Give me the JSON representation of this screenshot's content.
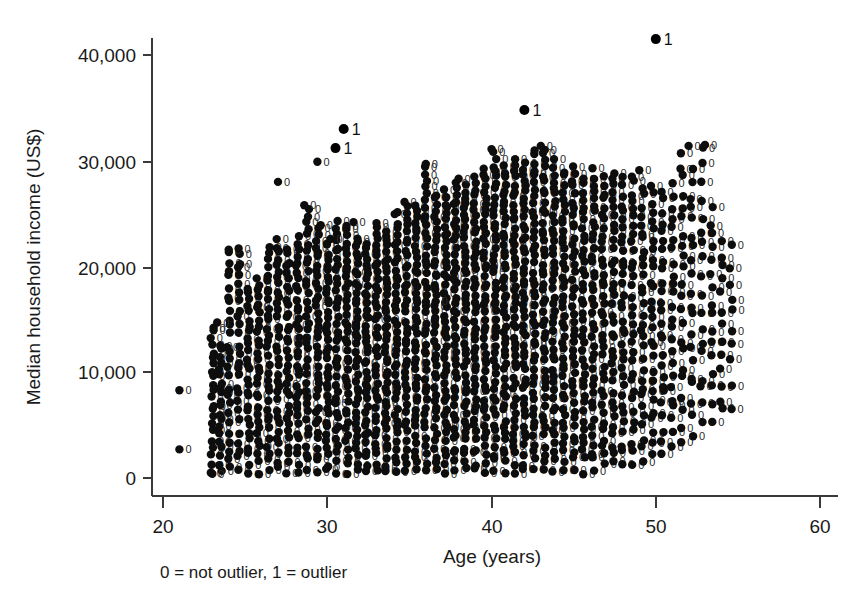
{
  "chart_data": {
    "type": "scatter",
    "title": "",
    "xlabel": "Age (years)",
    "ylabel": "Median household income (US$)",
    "xlim": [
      20,
      60
    ],
    "ylim": [
      0,
      44000
    ],
    "xticks": [
      20,
      30,
      40,
      50,
      60
    ],
    "xtick_labels": [
      "20",
      "30",
      "40",
      "50",
      "60"
    ],
    "yticks": [
      0,
      10000,
      20000,
      30000,
      40000
    ],
    "ytick_labels": [
      "0",
      "10,000",
      "20,000",
      "30,000",
      "40,000"
    ],
    "grid": false,
    "legend": "none",
    "caption": "0 = not outlier, 1 = outlier",
    "marker_label_key": {
      "0": "not outlier",
      "1": "outlier"
    },
    "point_marker": "filled-circle-with-numeric-label",
    "n_outliers": 4,
    "outliers": [
      {
        "x": 50.0,
        "y": 41500,
        "label": "1"
      },
      {
        "x": 42.0,
        "y": 34800,
        "label": "1"
      },
      {
        "x": 31.0,
        "y": 33000,
        "label": "1"
      },
      {
        "x": 30.5,
        "y": 31200,
        "label": "1"
      }
    ],
    "isolated_points": [
      {
        "x": 21.0,
        "y": 8300,
        "label": "0"
      },
      {
        "x": 21.0,
        "y": 2700,
        "label": "0"
      },
      {
        "x": 23.0,
        "y": 400,
        "label": "0"
      },
      {
        "x": 23.3,
        "y": 14700,
        "label": "0"
      },
      {
        "x": 24.0,
        "y": 21600,
        "label": "0"
      },
      {
        "x": 24.6,
        "y": 21700,
        "label": "0"
      },
      {
        "x": 27.0,
        "y": 28000,
        "label": "0"
      },
      {
        "x": 28.6,
        "y": 25800,
        "label": "0"
      },
      {
        "x": 29.4,
        "y": 29900,
        "label": "0"
      },
      {
        "x": 29.6,
        "y": 23900,
        "label": "0"
      },
      {
        "x": 30.2,
        "y": 22600,
        "label": "0"
      },
      {
        "x": 31.6,
        "y": 24200,
        "label": "0"
      },
      {
        "x": 33.0,
        "y": 24100,
        "label": "0"
      },
      {
        "x": 36.0,
        "y": 29700,
        "label": "0"
      },
      {
        "x": 36.6,
        "y": 16700,
        "label": "0"
      },
      {
        "x": 38.0,
        "y": 28300,
        "label": "0"
      },
      {
        "x": 40.0,
        "y": 31100,
        "label": "0"
      },
      {
        "x": 43.0,
        "y": 31400,
        "label": "0"
      },
      {
        "x": 49.0,
        "y": 29100,
        "label": "0"
      },
      {
        "x": 52.0,
        "y": 31400,
        "label": "0"
      },
      {
        "x": 53.0,
        "y": 31500,
        "label": "0"
      }
    ],
    "columns": [
      {
        "x": 23.0,
        "ymin": 300,
        "ymax": 14800,
        "density": 22
      },
      {
        "x": 23.5,
        "ymin": 300,
        "ymax": 13000,
        "density": 20
      },
      {
        "x": 24.0,
        "ymin": 300,
        "ymax": 21600,
        "density": 26
      },
      {
        "x": 24.6,
        "ymin": 300,
        "ymax": 21700,
        "density": 26
      },
      {
        "x": 25.2,
        "ymin": 300,
        "ymax": 18400,
        "density": 28
      },
      {
        "x": 25.8,
        "ymin": 300,
        "ymax": 19300,
        "density": 30
      },
      {
        "x": 26.4,
        "ymin": 300,
        "ymax": 22200,
        "density": 32
      },
      {
        "x": 27.0,
        "ymin": 300,
        "ymax": 22900,
        "density": 34
      },
      {
        "x": 27.6,
        "ymin": 300,
        "ymax": 22000,
        "density": 34
      },
      {
        "x": 28.2,
        "ymin": 300,
        "ymax": 23200,
        "density": 36
      },
      {
        "x": 28.8,
        "ymin": 300,
        "ymax": 25900,
        "density": 36
      },
      {
        "x": 29.4,
        "ymin": 300,
        "ymax": 24000,
        "density": 38
      },
      {
        "x": 30.0,
        "ymin": 300,
        "ymax": 22700,
        "density": 38
      },
      {
        "x": 30.6,
        "ymin": 300,
        "ymax": 24600,
        "density": 38
      },
      {
        "x": 31.2,
        "ymin": 300,
        "ymax": 24200,
        "density": 40
      },
      {
        "x": 31.8,
        "ymin": 300,
        "ymax": 23100,
        "density": 40
      },
      {
        "x": 32.4,
        "ymin": 300,
        "ymax": 22600,
        "density": 40
      },
      {
        "x": 33.0,
        "ymin": 300,
        "ymax": 24100,
        "density": 40
      },
      {
        "x": 33.6,
        "ymin": 300,
        "ymax": 23800,
        "density": 42
      },
      {
        "x": 34.2,
        "ymin": 300,
        "ymax": 25600,
        "density": 42
      },
      {
        "x": 34.8,
        "ymin": 300,
        "ymax": 26400,
        "density": 42
      },
      {
        "x": 35.4,
        "ymin": 300,
        "ymax": 26100,
        "density": 44
      },
      {
        "x": 36.0,
        "ymin": 300,
        "ymax": 29700,
        "density": 44
      },
      {
        "x": 36.6,
        "ymin": 300,
        "ymax": 27200,
        "density": 44
      },
      {
        "x": 37.2,
        "ymin": 300,
        "ymax": 27400,
        "density": 46
      },
      {
        "x": 37.8,
        "ymin": 300,
        "ymax": 28300,
        "density": 46
      },
      {
        "x": 38.4,
        "ymin": 300,
        "ymax": 27900,
        "density": 46
      },
      {
        "x": 39.0,
        "ymin": 300,
        "ymax": 28600,
        "density": 46
      },
      {
        "x": 39.6,
        "ymin": 300,
        "ymax": 29800,
        "density": 48
      },
      {
        "x": 40.2,
        "ymin": 300,
        "ymax": 31100,
        "density": 48
      },
      {
        "x": 40.8,
        "ymin": 300,
        "ymax": 29900,
        "density": 48
      },
      {
        "x": 41.4,
        "ymin": 300,
        "ymax": 30400,
        "density": 48
      },
      {
        "x": 42.0,
        "ymin": 300,
        "ymax": 30200,
        "density": 48
      },
      {
        "x": 42.6,
        "ymin": 300,
        "ymax": 31400,
        "density": 46
      },
      {
        "x": 43.2,
        "ymin": 300,
        "ymax": 31500,
        "density": 46
      },
      {
        "x": 43.8,
        "ymin": 300,
        "ymax": 30300,
        "density": 44
      },
      {
        "x": 44.4,
        "ymin": 300,
        "ymax": 29400,
        "density": 44
      },
      {
        "x": 45.0,
        "ymin": 300,
        "ymax": 29800,
        "density": 42
      },
      {
        "x": 45.6,
        "ymin": 300,
        "ymax": 28700,
        "density": 40
      },
      {
        "x": 46.2,
        "ymin": 300,
        "ymax": 29600,
        "density": 40
      },
      {
        "x": 46.8,
        "ymin": 600,
        "ymax": 28800,
        "density": 38
      },
      {
        "x": 47.4,
        "ymin": 700,
        "ymax": 29500,
        "density": 36
      },
      {
        "x": 48.0,
        "ymin": 900,
        "ymax": 28600,
        "density": 34
      },
      {
        "x": 48.6,
        "ymin": 1000,
        "ymax": 29100,
        "density": 32
      },
      {
        "x": 49.2,
        "ymin": 1200,
        "ymax": 27900,
        "density": 30
      },
      {
        "x": 49.8,
        "ymin": 1400,
        "ymax": 28300,
        "density": 28
      },
      {
        "x": 50.4,
        "ymin": 1800,
        "ymax": 27600,
        "density": 26
      },
      {
        "x": 51.0,
        "ymin": 2200,
        "ymax": 28100,
        "density": 24
      },
      {
        "x": 51.6,
        "ymin": 2600,
        "ymax": 31400,
        "density": 22
      },
      {
        "x": 52.2,
        "ymin": 3200,
        "ymax": 30100,
        "density": 20
      },
      {
        "x": 52.8,
        "ymin": 3800,
        "ymax": 31500,
        "density": 18
      },
      {
        "x": 53.4,
        "ymin": 4600,
        "ymax": 26400,
        "density": 16
      },
      {
        "x": 54.0,
        "ymin": 5400,
        "ymax": 23200,
        "density": 13
      },
      {
        "x": 54.6,
        "ymin": 6200,
        "ymax": 22600,
        "density": 10
      }
    ]
  },
  "axes": {
    "y_title": "Median household income (US$)",
    "x_title": "Age (years)",
    "x_tick_20": "20",
    "x_tick_30": "30",
    "x_tick_40": "40",
    "x_tick_50": "50",
    "x_tick_60": "60",
    "y_tick_0": "0",
    "y_tick_10k": "10,000",
    "y_tick_20k": "20,000",
    "y_tick_30k": "30,000",
    "y_tick_40k": "40,000"
  },
  "caption": {
    "text": "0 = not outlier, 1 = outlier"
  },
  "colors": {
    "marker": "#0d0d0d",
    "axis": "#3a3a3a",
    "text": "#1a1a1a",
    "background": "#ffffff"
  }
}
